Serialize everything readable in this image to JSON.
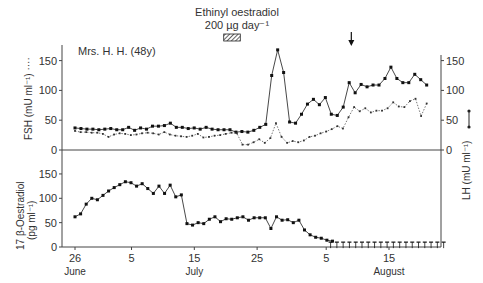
{
  "chart_data": [
    {
      "type": "line",
      "panel": "top",
      "subject_label": "Mrs. H. H. (48y)",
      "treatment_label_line1": "Ethinyl oestradiol",
      "treatment_label_line2": "200 µg day⁻¹",
      "treatment_days": [
        24,
        26
      ],
      "arrow_day": 44,
      "ylabel_left": "FSH (mU ml⁻¹) ····",
      "ylabel_right": "LH (mU ml⁻¹)",
      "ylim": [
        0,
        160
      ],
      "yticks": [
        0,
        50,
        100,
        150
      ],
      "xlim": [
        0,
        57
      ],
      "series": [
        {
          "name": "LH",
          "style": "solid",
          "x": [
            0,
            1,
            2,
            3,
            4,
            5,
            6,
            7,
            8,
            9,
            10,
            11,
            12,
            13,
            14,
            15,
            16,
            17,
            18,
            19,
            20,
            21,
            22,
            23,
            24,
            25,
            26,
            27,
            28,
            29,
            30,
            31,
            32,
            33,
            34,
            35,
            36,
            37,
            38,
            39,
            40,
            41,
            42,
            43,
            44,
            45,
            46,
            47,
            48,
            49,
            50,
            51,
            52,
            53,
            54,
            55
          ],
          "values": [
            37,
            36,
            35,
            35,
            34,
            35,
            36,
            34,
            34,
            38,
            33,
            37,
            35,
            40,
            40,
            41,
            45,
            38,
            38,
            36,
            37,
            35,
            38,
            35,
            34,
            34,
            34,
            30,
            31,
            30,
            33,
            38,
            43,
            125,
            168,
            130,
            47,
            45,
            60,
            77,
            85,
            76,
            88,
            60,
            58,
            72,
            113,
            96,
            110,
            106,
            109,
            109,
            120,
            139,
            120,
            113,
            113,
            127,
            118,
            109
          ],
          "x_note": "day index from 26 June"
        },
        {
          "name": "FSH",
          "style": "dotted",
          "values": [
            32,
            30,
            30,
            29,
            29,
            27,
            22,
            26,
            28,
            27,
            25,
            26,
            28,
            29,
            28,
            26,
            30,
            26,
            24,
            23,
            22,
            24,
            27,
            21,
            22,
            24,
            25,
            27,
            29,
            28,
            9,
            9,
            13,
            18,
            12,
            20,
            45,
            22,
            12,
            15,
            13,
            16,
            22,
            24,
            28,
            31,
            35,
            40,
            36,
            55,
            72,
            65,
            70,
            63,
            66,
            66,
            70,
            80,
            73,
            72,
            82,
            86,
            57,
            78
          ],
          "x_start_note": "continuous daily from day 0"
        }
      ]
    },
    {
      "type": "line",
      "panel": "bottom",
      "ylabel": "17 β-Oestradiol (pg ml⁻¹)",
      "ylim": [
        0,
        170
      ],
      "yticks": [
        0,
        50,
        100,
        150
      ],
      "xticks": [
        {
          "day": 0,
          "label": "26"
        },
        {
          "day": 9,
          "label": "5"
        },
        {
          "day": 19,
          "label": "15"
        },
        {
          "day": 29,
          "label": "25"
        },
        {
          "day": 40,
          "label": "5"
        },
        {
          "day": 50,
          "label": "15"
        }
      ],
      "month_labels": [
        {
          "day": 0,
          "label": "June"
        },
        {
          "day": 19,
          "label": "July"
        },
        {
          "day": 50,
          "label": "August"
        }
      ],
      "series": [
        {
          "name": "17β-Oestradiol",
          "style": "solid",
          "values": [
            62,
            68,
            88,
            100,
            97,
            106,
            115,
            122,
            128,
            134,
            132,
            125,
            130,
            120,
            110,
            125,
            110,
            127,
            103,
            107,
            48,
            45,
            50,
            48,
            57,
            62,
            52,
            58,
            57,
            60,
            62,
            55,
            60,
            60,
            60,
            38,
            62,
            55,
            56,
            50,
            55,
            35,
            25,
            20,
            18,
            14,
            12
          ],
          "below_detection_days": [
            41,
            42,
            43,
            44,
            45,
            46,
            47,
            48,
            49,
            50,
            51,
            52,
            53,
            54,
            55,
            56,
            57,
            58,
            59
          ],
          "below_detection_value": 10
        }
      ]
    }
  ]
}
